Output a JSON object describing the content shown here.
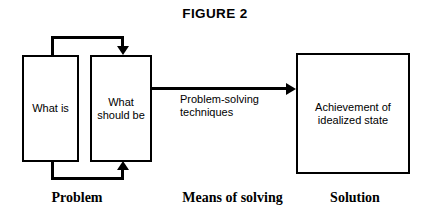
{
  "figure": {
    "title": "FIGURE 2"
  },
  "nodes": {
    "what_is": {
      "label": "What is",
      "name": "what-is-box"
    },
    "what_should_be": {
      "label": "What\nshould be",
      "name": "what-should-be-box"
    },
    "achievement": {
      "label": "Achievement of\nidealized state",
      "name": "achievement-box"
    }
  },
  "connectors": {
    "top_feedback": {
      "name": "top-feedback-arrow",
      "from": "what_is",
      "to": "what_should_be",
      "label": ""
    },
    "bottom_feedback": {
      "name": "bottom-feedback-arrow",
      "from": "what_is",
      "to": "what_should_be",
      "label": ""
    },
    "solving_arrow": {
      "name": "problem-solving-arrow",
      "from": "what_should_be",
      "to": "achievement",
      "label": "Problem-solving\ntechniques"
    }
  },
  "captions": {
    "problem": "Problem",
    "means_of_solving": "Means of solving",
    "solution": "Solution"
  },
  "colors": {
    "stroke": "#000000",
    "background": "#ffffff",
    "text": "#000000"
  }
}
